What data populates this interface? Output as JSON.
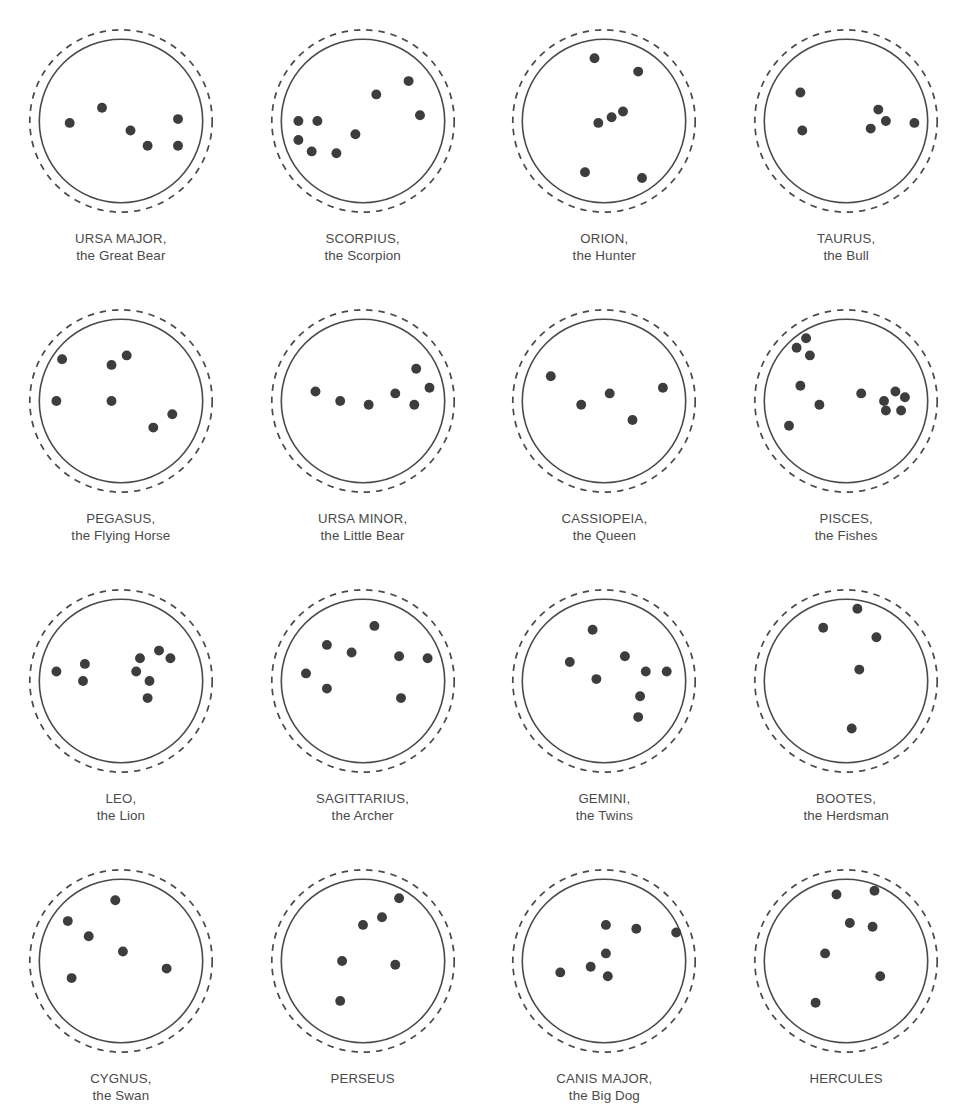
{
  "page": {
    "background_color": "#ffffff",
    "ink_color": "#4a4a4a",
    "star_color": "#3d3d3d",
    "columns": 4,
    "rows": 4
  },
  "legend": {
    "outer_ring": "dashed-circle",
    "inner_ring": "solid-circle",
    "marker": "filled-dot-star"
  },
  "constellations": [
    {
      "id": "ursa-major",
      "name": "URSA MAJOR,",
      "common_name": "the Great Bear",
      "star_count": 6,
      "stars": [
        {
          "x": 23,
          "y": 51
        },
        {
          "x": 40,
          "y": 43
        },
        {
          "x": 55,
          "y": 55
        },
        {
          "x": 64,
          "y": 63
        },
        {
          "x": 80,
          "y": 49
        },
        {
          "x": 80,
          "y": 63
        }
      ]
    },
    {
      "id": "scorpius",
      "name": "SCORPIUS,",
      "common_name": "the Scorpion",
      "star_count": 8,
      "stars": [
        {
          "x": 74,
          "y": 29
        },
        {
          "x": 57,
          "y": 36
        },
        {
          "x": 80,
          "y": 47
        },
        {
          "x": 16,
          "y": 50
        },
        {
          "x": 26,
          "y": 50
        },
        {
          "x": 16,
          "y": 60
        },
        {
          "x": 23,
          "y": 66
        },
        {
          "x": 36,
          "y": 67
        },
        {
          "x": 46,
          "y": 57
        }
      ]
    },
    {
      "id": "orion",
      "name": "ORION,",
      "common_name": "the Hunter",
      "star_count": 7,
      "stars": [
        {
          "x": 45,
          "y": 17
        },
        {
          "x": 68,
          "y": 24
        },
        {
          "x": 47,
          "y": 51
        },
        {
          "x": 54,
          "y": 48
        },
        {
          "x": 60,
          "y": 45
        },
        {
          "x": 40,
          "y": 77
        },
        {
          "x": 70,
          "y": 80
        }
      ]
    },
    {
      "id": "taurus",
      "name": "TAURUS,",
      "common_name": "the Bull",
      "star_count": 6,
      "stars": [
        {
          "x": 26,
          "y": 35
        },
        {
          "x": 27,
          "y": 55
        },
        {
          "x": 63,
          "y": 54
        },
        {
          "x": 67,
          "y": 44
        },
        {
          "x": 71,
          "y": 50
        },
        {
          "x": 86,
          "y": 51
        }
      ]
    },
    {
      "id": "pegasus",
      "name": "PEGASUS,",
      "common_name": "the Flying Horse",
      "star_count": 6,
      "stars": [
        {
          "x": 19,
          "y": 28
        },
        {
          "x": 45,
          "y": 31
        },
        {
          "x": 53,
          "y": 26
        },
        {
          "x": 16,
          "y": 50
        },
        {
          "x": 45,
          "y": 50
        },
        {
          "x": 67,
          "y": 64
        },
        {
          "x": 77,
          "y": 57
        }
      ]
    },
    {
      "id": "ursa-minor",
      "name": "URSA MINOR,",
      "common_name": "the Little Bear",
      "star_count": 7,
      "stars": [
        {
          "x": 25,
          "y": 45
        },
        {
          "x": 38,
          "y": 50
        },
        {
          "x": 53,
          "y": 52
        },
        {
          "x": 67,
          "y": 46
        },
        {
          "x": 77,
          "y": 52
        },
        {
          "x": 78,
          "y": 33
        },
        {
          "x": 85,
          "y": 43
        }
      ]
    },
    {
      "id": "cassiopeia",
      "name": "CASSIOPEIA,",
      "common_name": "the Queen",
      "star_count": 5,
      "stars": [
        {
          "x": 22,
          "y": 37
        },
        {
          "x": 38,
          "y": 52
        },
        {
          "x": 53,
          "y": 46
        },
        {
          "x": 65,
          "y": 60
        },
        {
          "x": 81,
          "y": 43
        }
      ]
    },
    {
      "id": "pisces",
      "name": "PISCES,",
      "common_name": "the Fishes",
      "star_count": 12,
      "stars": [
        {
          "x": 29,
          "y": 17
        },
        {
          "x": 24,
          "y": 22
        },
        {
          "x": 31,
          "y": 26
        },
        {
          "x": 26,
          "y": 42
        },
        {
          "x": 36,
          "y": 52
        },
        {
          "x": 20,
          "y": 63
        },
        {
          "x": 58,
          "y": 46
        },
        {
          "x": 70,
          "y": 50
        },
        {
          "x": 76,
          "y": 45
        },
        {
          "x": 81,
          "y": 48
        },
        {
          "x": 71,
          "y": 55
        },
        {
          "x": 79,
          "y": 55
        }
      ]
    },
    {
      "id": "leo",
      "name": "LEO,",
      "common_name": "the Lion",
      "star_count": 9,
      "stars": [
        {
          "x": 16,
          "y": 45
        },
        {
          "x": 31,
          "y": 41
        },
        {
          "x": 30,
          "y": 50
        },
        {
          "x": 60,
          "y": 38
        },
        {
          "x": 58,
          "y": 45
        },
        {
          "x": 70,
          "y": 34
        },
        {
          "x": 76,
          "y": 38
        },
        {
          "x": 65,
          "y": 50
        },
        {
          "x": 64,
          "y": 59
        }
      ]
    },
    {
      "id": "sagittarius",
      "name": "SAGITTARIUS,",
      "common_name": "the Archer",
      "star_count": 8,
      "stars": [
        {
          "x": 56,
          "y": 21
        },
        {
          "x": 31,
          "y": 31
        },
        {
          "x": 44,
          "y": 35
        },
        {
          "x": 20,
          "y": 46
        },
        {
          "x": 31,
          "y": 54
        },
        {
          "x": 69,
          "y": 37
        },
        {
          "x": 84,
          "y": 38
        },
        {
          "x": 70,
          "y": 59
        }
      ]
    },
    {
      "id": "gemini",
      "name": "GEMINI,",
      "common_name": "the Twins",
      "star_count": 7,
      "stars": [
        {
          "x": 44,
          "y": 23
        },
        {
          "x": 32,
          "y": 40
        },
        {
          "x": 61,
          "y": 37
        },
        {
          "x": 46,
          "y": 49
        },
        {
          "x": 72,
          "y": 45
        },
        {
          "x": 83,
          "y": 45
        },
        {
          "x": 69,
          "y": 58
        },
        {
          "x": 68,
          "y": 69
        }
      ]
    },
    {
      "id": "bootes",
      "name": "BOOTES,",
      "common_name": "the Herdsman",
      "star_count": 5,
      "stars": [
        {
          "x": 56,
          "y": 12
        },
        {
          "x": 38,
          "y": 22
        },
        {
          "x": 66,
          "y": 27
        },
        {
          "x": 57,
          "y": 44
        },
        {
          "x": 53,
          "y": 75
        }
      ]
    },
    {
      "id": "cygnus",
      "name": "CYGNUS,",
      "common_name": "the Swan",
      "star_count": 6,
      "stars": [
        {
          "x": 47,
          "y": 18
        },
        {
          "x": 22,
          "y": 29
        },
        {
          "x": 33,
          "y": 37
        },
        {
          "x": 51,
          "y": 45
        },
        {
          "x": 24,
          "y": 59
        },
        {
          "x": 74,
          "y": 54
        }
      ]
    },
    {
      "id": "perseus",
      "name": "PERSEUS",
      "common_name": "",
      "star_count": 6,
      "stars": [
        {
          "x": 69,
          "y": 17
        },
        {
          "x": 60,
          "y": 27
        },
        {
          "x": 50,
          "y": 31
        },
        {
          "x": 39,
          "y": 50
        },
        {
          "x": 67,
          "y": 52
        },
        {
          "x": 38,
          "y": 71
        }
      ]
    },
    {
      "id": "canis-major",
      "name": "CANIS MAJOR,",
      "common_name": "the Big Dog",
      "star_count": 7,
      "stars": [
        {
          "x": 51,
          "y": 31
        },
        {
          "x": 67,
          "y": 33
        },
        {
          "x": 88,
          "y": 35
        },
        {
          "x": 51,
          "y": 46
        },
        {
          "x": 43,
          "y": 53
        },
        {
          "x": 27,
          "y": 56
        },
        {
          "x": 52,
          "y": 58
        }
      ]
    },
    {
      "id": "hercules",
      "name": "HERCULES",
      "common_name": "",
      "star_count": 7,
      "stars": [
        {
          "x": 45,
          "y": 15
        },
        {
          "x": 65,
          "y": 13
        },
        {
          "x": 52,
          "y": 30
        },
        {
          "x": 64,
          "y": 32
        },
        {
          "x": 39,
          "y": 46
        },
        {
          "x": 68,
          "y": 58
        },
        {
          "x": 34,
          "y": 72
        }
      ]
    }
  ]
}
